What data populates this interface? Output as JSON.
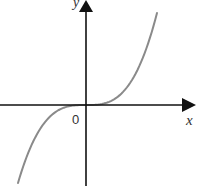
{
  "chart_data": {
    "type": "line",
    "title": "",
    "xlabel": "x",
    "ylabel": "y",
    "origin_label": "0",
    "function": "y = x^3",
    "grid": false,
    "legend": null,
    "axes": {
      "x_arrow": true,
      "y_arrow": true,
      "ticks": []
    },
    "series": [
      {
        "name": "y = x^3",
        "color": "#8a8a8a",
        "x": [
          -1.0,
          -0.75,
          -0.5,
          -0.25,
          0,
          0.25,
          0.5,
          0.75,
          1.0
        ],
        "y": [
          -1.0,
          -0.42,
          -0.125,
          -0.016,
          0,
          0.016,
          0.125,
          0.42,
          1.0
        ]
      }
    ],
    "colors": {
      "axis": "#111111",
      "curve": "#8a8a8a",
      "background": "#ffffff"
    }
  }
}
